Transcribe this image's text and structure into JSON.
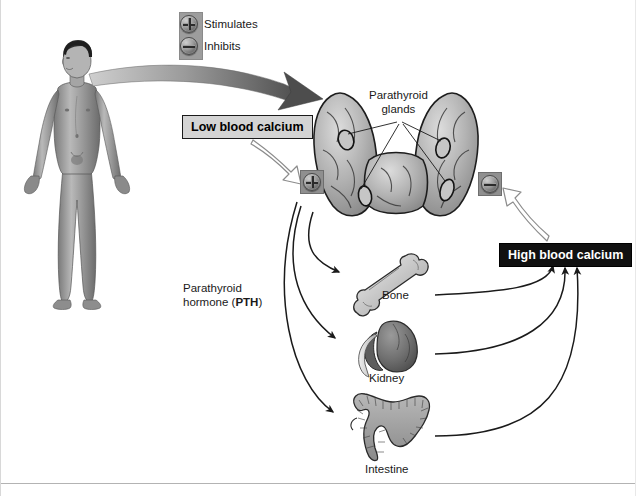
{
  "figure": {
    "background": "#ffffff"
  },
  "legend": {
    "items": [
      {
        "icon": "plus-circle-icon",
        "label": "Stimulates",
        "symbol": "+"
      },
      {
        "icon": "minus-circle-icon",
        "label": "Inhibits",
        "symbol": "–"
      }
    ]
  },
  "labels": {
    "low_blood_calcium": "Low blood calcium",
    "high_blood_calcium": "High blood calcium",
    "parathyroid_glands": "Parathyroid\nglands",
    "parathyroid_glands_line1": "Parathyroid",
    "parathyroid_glands_line2": "glands",
    "pth_line1": "Parathyroid",
    "pth_line2": "hormone (",
    "pth_bold": "PTH",
    "pth_line2_end": ")",
    "bone": "Bone",
    "kidney": "Kidney",
    "intestine": "Intestine"
  },
  "organs": [
    {
      "name": "bone",
      "label": "Bone"
    },
    {
      "name": "kidney",
      "label": "Kidney"
    },
    {
      "name": "intestine",
      "label": "Intestine"
    }
  ],
  "badges": [
    {
      "name": "stimulates-badge",
      "symbol": "+",
      "meaning": "Stimulates"
    },
    {
      "name": "inhibits-badge",
      "symbol": "–",
      "meaning": "Inhibits"
    }
  ],
  "colors": {
    "low_calcium_box_bg": "#d4d4d4",
    "low_calcium_box_text": "#000000",
    "high_calcium_box_bg": "#111111",
    "high_calcium_box_text": "#ffffff",
    "legend_panel": "#9d9d9d",
    "badge_panel": "#8f8f8f",
    "arrow_black": "#1a1a1a",
    "arrow_hollow_outline": "#8c8c8c",
    "organ_gray": "#7d7d7d",
    "body_gray": "#8e8e8e",
    "thyroid_gray": "#b5b5b5",
    "rule": "#b3b3b3"
  },
  "flow": {
    "body_to_gland": "curved gradient arrow from body neck to parathyroid glands",
    "low_calcium_to_plus": "hollow arrow",
    "high_calcium_to_minus": "hollow arrow",
    "gland_to_organs": [
      "Bone",
      "Kidney",
      "Intestine"
    ],
    "organs_to_high_calcium": [
      "Bone",
      "Kidney",
      "Intestine"
    ]
  }
}
